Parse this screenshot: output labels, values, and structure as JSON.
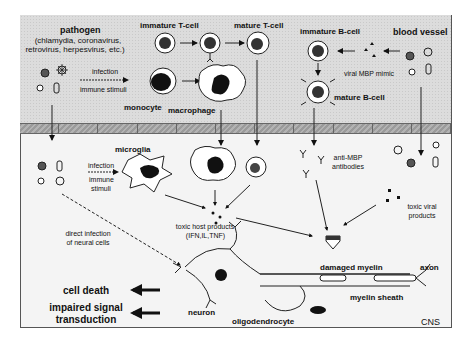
{
  "compartments": {
    "blood_vessel": {
      "label": "blood vessel"
    },
    "cns": {
      "label": "CNS"
    }
  },
  "blood": {
    "pathogen": {
      "title": "pathogen",
      "examples": "(chlamydia, coronavirus,",
      "examples2": "retrovirus, herpesvirus, etc.)"
    },
    "infection_label": "infection",
    "immune_label": "immune stimuli",
    "immature_tcell": "immature T-cell",
    "mature_tcell": "mature T-cell",
    "monocyte": "monocyte",
    "macrophage": "macrophage",
    "immature_bcell": "immature B-cell",
    "mature_bcell": "mature B-cell",
    "viral_mimic": "viral MBP mimic"
  },
  "cns": {
    "microglia": "microglia",
    "infection_label": "infection",
    "immune_label1": "immune",
    "immune_label2": "stimuli",
    "anti_mbp1": "anti-MBP",
    "anti_mbp2": "antibodies",
    "toxic_host1": "toxic host products",
    "toxic_host2": "(IFN,IL,TNF)",
    "toxic_viral1": "toxic viral",
    "toxic_viral2": "products",
    "direct1": "direct infection",
    "direct2": "of neural cells",
    "damaged_myelin": "damaged myelin",
    "axon": "axon",
    "myelin_sheath": "myelin sheath",
    "neuron": "neuron",
    "oligodendrocyte": "oligodendrocyte",
    "cell_death": "cell death",
    "impaired1": "impaired signal",
    "impaired2": "transduction"
  },
  "colors": {
    "blood_bg": "#dcdcdc",
    "cns_bg": "#f4f4f4",
    "membrane": "#a6a6a6",
    "ink": "#111111"
  }
}
